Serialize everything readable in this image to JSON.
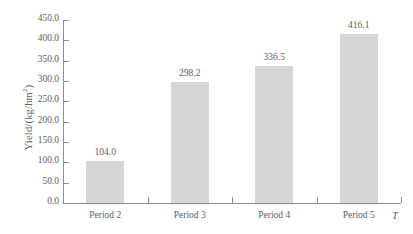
{
  "chart_data": {
    "type": "bar",
    "title": "",
    "subtitle": "",
    "xlabel": "T",
    "ylabel": "Yield/(kg/hm²)",
    "ylabel_main": "Yield/(kg/hm",
    "ylabel_sup": "2",
    "ylabel_tail": ")",
    "categories": [
      "Period 2",
      "Period 3",
      "Period 4",
      "Period 5"
    ],
    "values": [
      104.0,
      298.2,
      336.5,
      416.1
    ],
    "value_labels": [
      "104.0",
      "298.2",
      "336.5",
      "416.1"
    ],
    "ylim": [
      0.0,
      450.0
    ],
    "ytick_step": 50.0,
    "ytick_labels": [
      "450.0",
      "400.0",
      "350.0",
      "300.0",
      "250.0",
      "200.0",
      "150.0",
      "100.0",
      "50.0",
      "0.0"
    ],
    "ytick_values": [
      450.0,
      400.0,
      350.0,
      300.0,
      250.0,
      200.0,
      150.0,
      100.0,
      50.0,
      0.0
    ],
    "grid": false,
    "legend": "none",
    "bar_color": "#d6d6d6",
    "axis_color": "#8d8d8d",
    "text_color": "#5e5e5e",
    "background": "#ffffff"
  }
}
